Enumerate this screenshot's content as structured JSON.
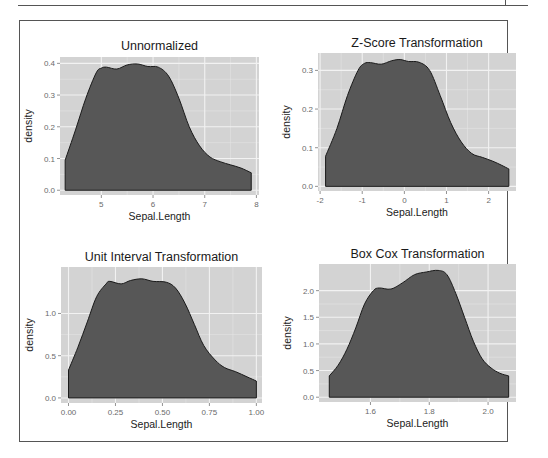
{
  "figure": {
    "background": "#ffffff",
    "panel_background": "#d3d3d3",
    "grid_color": "#f2f2f2",
    "fill_color": "#575757",
    "line_color": "#1a1a1a"
  },
  "chart_data": [
    {
      "type": "area",
      "title": "Unnormalized",
      "xlabel": "Sepal.Length",
      "ylabel": "density",
      "xlim": [
        4.2,
        8.05
      ],
      "ylim": [
        -0.015,
        0.42
      ],
      "xticks": [
        5,
        6,
        7,
        8
      ],
      "xtick_labels": [
        "5",
        "6",
        "7",
        "8"
      ],
      "yticks": [
        0.0,
        0.1,
        0.2,
        0.3,
        0.4
      ],
      "ytick_labels": [
        "0.0",
        "0.1",
        "0.2",
        "0.3",
        "0.4"
      ],
      "grid": true,
      "x": [
        4.3,
        4.5,
        4.7,
        4.9,
        5.0,
        5.1,
        5.3,
        5.5,
        5.7,
        5.9,
        6.1,
        6.3,
        6.5,
        6.7,
        6.9,
        7.1,
        7.3,
        7.5,
        7.7,
        7.9
      ],
      "values": [
        0.095,
        0.19,
        0.29,
        0.37,
        0.385,
        0.388,
        0.382,
        0.395,
        0.398,
        0.39,
        0.388,
        0.36,
        0.29,
        0.2,
        0.14,
        0.105,
        0.09,
        0.08,
        0.07,
        0.055
      ]
    },
    {
      "type": "area",
      "title": "Z-Score Transformation",
      "xlabel": "Sepal.Length",
      "ylabel": "density",
      "xlim": [
        -2.05,
        2.65
      ],
      "ylim": [
        -0.012,
        0.345
      ],
      "xticks": [
        -2,
        -1,
        0,
        1,
        2
      ],
      "xtick_labels": [
        "-2",
        "-1",
        "0",
        "1",
        "2"
      ],
      "yticks": [
        0.0,
        0.1,
        0.2,
        0.3
      ],
      "ytick_labels": [
        "0.0",
        "0.1",
        "0.2",
        "0.3"
      ],
      "grid": true,
      "x": [
        -1.87,
        -1.6,
        -1.35,
        -1.1,
        -0.95,
        -0.8,
        -0.55,
        -0.3,
        -0.1,
        0.1,
        0.35,
        0.6,
        0.85,
        1.1,
        1.35,
        1.6,
        1.85,
        2.1,
        2.3,
        2.48
      ],
      "values": [
        0.078,
        0.15,
        0.235,
        0.3,
        0.318,
        0.32,
        0.316,
        0.325,
        0.328,
        0.323,
        0.321,
        0.3,
        0.235,
        0.165,
        0.115,
        0.085,
        0.075,
        0.065,
        0.055,
        0.045
      ]
    },
    {
      "type": "area",
      "title": "Unit Interval Transformation",
      "xlabel": "Sepal.Length",
      "ylabel": "density",
      "xlim": [
        -0.04,
        1.03
      ],
      "ylim": [
        -0.06,
        1.55
      ],
      "xticks": [
        0.0,
        0.25,
        0.5,
        0.75,
        1.0
      ],
      "xtick_labels": [
        "0.00",
        "0.25",
        "0.50",
        "0.75",
        "1.00"
      ],
      "yticks": [
        0.0,
        0.5,
        1.0
      ],
      "ytick_labels": [
        "0.0",
        "0.5",
        "1.0"
      ],
      "grid": true,
      "x": [
        0.0,
        0.05,
        0.1,
        0.15,
        0.2,
        0.22,
        0.28,
        0.33,
        0.39,
        0.45,
        0.52,
        0.57,
        0.62,
        0.67,
        0.72,
        0.78,
        0.83,
        0.89,
        0.95,
        1.0
      ],
      "values": [
        0.33,
        0.6,
        0.9,
        1.2,
        1.35,
        1.38,
        1.35,
        1.39,
        1.41,
        1.38,
        1.37,
        1.3,
        1.12,
        0.87,
        0.62,
        0.45,
        0.36,
        0.31,
        0.25,
        0.2
      ]
    },
    {
      "type": "area",
      "title": "Box Cox Transformation",
      "xlabel": "Sepal.Length",
      "ylabel": "density",
      "xlim": [
        1.425,
        2.095
      ],
      "ylim": [
        -0.09,
        2.5
      ],
      "xticks": [
        1.6,
        1.8,
        2.0
      ],
      "xtick_labels": [
        "1.6",
        "1.8",
        "2.0"
      ],
      "yticks": [
        0.0,
        0.5,
        1.0,
        1.5,
        2.0
      ],
      "ytick_labels": [
        "0.0",
        "0.5",
        "1.0",
        "1.5",
        "2.0"
      ],
      "grid": true,
      "x": [
        1.46,
        1.49,
        1.52,
        1.55,
        1.58,
        1.61,
        1.63,
        1.67,
        1.71,
        1.75,
        1.79,
        1.83,
        1.86,
        1.89,
        1.92,
        1.95,
        1.98,
        2.01,
        2.04,
        2.07
      ],
      "values": [
        0.4,
        0.6,
        0.9,
        1.3,
        1.75,
        2.0,
        2.05,
        2.03,
        2.15,
        2.3,
        2.35,
        2.38,
        2.3,
        1.95,
        1.5,
        1.05,
        0.72,
        0.55,
        0.45,
        0.4
      ]
    }
  ]
}
